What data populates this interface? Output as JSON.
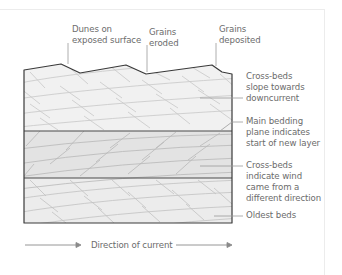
{
  "diagram": {
    "colors": {
      "outline": "#3a3a3a",
      "leader": "#9a9a9a",
      "text": "#6b6b6b",
      "top_layer_fill": "#f1f1f1",
      "middle_layer_fill": "#e3e3e3",
      "bottom_layer_fill": "#ececec",
      "bed_lines": "#c2c2c2"
    },
    "top_labels": [
      {
        "line1": "Dunes on",
        "line2": "exposed surface"
      },
      {
        "line1": "Grains",
        "line2": "eroded"
      },
      {
        "line1": "Grains",
        "line2": "deposited"
      }
    ],
    "side_labels": [
      {
        "line1": "Cross-beds",
        "line2": "slope towards",
        "line3": "downcurrent"
      },
      {
        "line1": "Main bedding",
        "line2": "plane indicates",
        "line3": "start of new layer"
      },
      {
        "line1": "Cross-beds",
        "line2": "indicate wind",
        "line3": "came from a",
        "line4": "different direction"
      },
      {
        "line1": "Oldest beds"
      }
    ],
    "direction": {
      "label": "Direction of current",
      "arrow_icon": "arrow-right-icon"
    }
  }
}
